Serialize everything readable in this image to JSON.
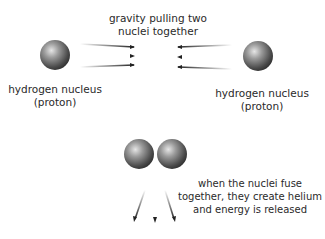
{
  "diagram": {
    "top_label": "gravity pulling two\nnuclei together",
    "left_nucleus": {
      "line1": "hydrogen nucleus",
      "line2": "(proton)"
    },
    "right_nucleus": {
      "line1": "hydrogen nucleus",
      "line2": "(proton)"
    },
    "fusion_label": {
      "line1": "when the nuclei fuse",
      "line2": "together, they create helium",
      "line3": "and energy is released"
    }
  }
}
